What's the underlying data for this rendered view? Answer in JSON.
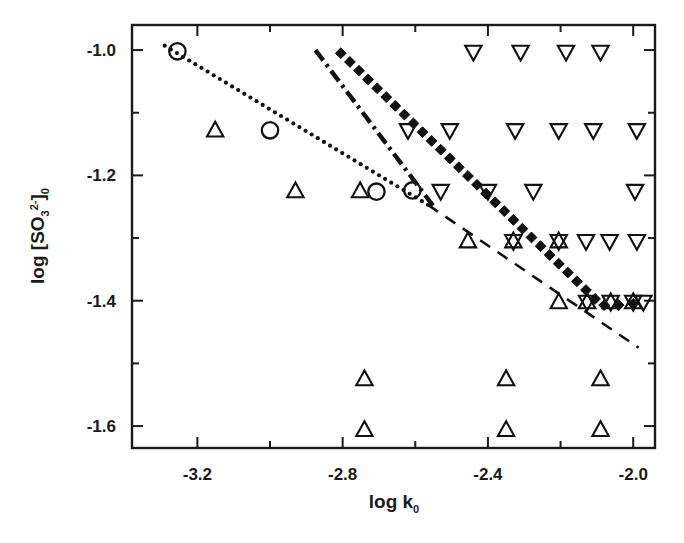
{
  "chart_data": {
    "type": "scatter",
    "title": "",
    "subtitle": "",
    "xlabel": "log k0",
    "xlabel_parts": {
      "base": "log k",
      "sub": "0"
    },
    "ylabel": "log [SO3 2-]0",
    "ylabel_parts": {
      "pre": "log [SO",
      "sub1": "3",
      "sup1": "2-",
      "post": "]",
      "sub2": "0"
    },
    "xlim": [
      -3.38,
      -1.94
    ],
    "ylim": [
      -1.635,
      -0.96
    ],
    "xticks": [
      -3.2,
      -2.8,
      -2.4,
      -2.0
    ],
    "xticklabels": [
      "-3.2",
      "-2.8",
      "-2.4",
      "-2.0"
    ],
    "xminorticks": [
      -3.0,
      -2.6,
      -2.2
    ],
    "yticks": [
      -1.0,
      -1.2,
      -1.4,
      -1.6
    ],
    "yticklabels": [
      "-1.0",
      "-1.2",
      "-1.4",
      "-1.6"
    ],
    "yminorticks": [
      -1.1,
      -1.3,
      -1.5
    ],
    "grid": false,
    "legend": "none",
    "frame": "box",
    "series": [
      {
        "name": "open-circle-points",
        "marker": "open-circle",
        "color": "#111111",
        "points": [
          {
            "x": -3.255,
            "y": -1.002
          },
          {
            "x": -3.0,
            "y": -1.128
          },
          {
            "x": -2.707,
            "y": -1.226
          },
          {
            "x": -2.608,
            "y": -1.224
          }
        ]
      },
      {
        "name": "up-triangle-points",
        "marker": "open-up-triangle",
        "color": "#111111",
        "points": [
          {
            "x": -3.151,
            "y": -1.128
          },
          {
            "x": -2.93,
            "y": -1.225
          },
          {
            "x": -2.752,
            "y": -1.225
          },
          {
            "x": -2.455,
            "y": -1.305
          },
          {
            "x": -2.33,
            "y": -1.305
          },
          {
            "x": -2.205,
            "y": -1.305
          },
          {
            "x": -2.205,
            "y": -1.402
          },
          {
            "x": -2.127,
            "y": -1.402
          },
          {
            "x": -2.062,
            "y": -1.402
          },
          {
            "x": -2.0,
            "y": -1.402
          },
          {
            "x": -2.74,
            "y": -1.525
          },
          {
            "x": -2.35,
            "y": -1.525
          },
          {
            "x": -2.09,
            "y": -1.525
          },
          {
            "x": -2.74,
            "y": -1.606
          },
          {
            "x": -2.35,
            "y": -1.606
          },
          {
            "x": -2.09,
            "y": -1.606
          }
        ]
      },
      {
        "name": "down-triangle-points",
        "marker": "open-down-triangle",
        "color": "#111111",
        "points": [
          {
            "x": -2.44,
            "y": -1.003
          },
          {
            "x": -2.31,
            "y": -1.003
          },
          {
            "x": -2.185,
            "y": -1.003
          },
          {
            "x": -2.09,
            "y": -1.003
          },
          {
            "x": -2.62,
            "y": -1.128
          },
          {
            "x": -2.505,
            "y": -1.128
          },
          {
            "x": -2.325,
            "y": -1.128
          },
          {
            "x": -2.205,
            "y": -1.128
          },
          {
            "x": -2.11,
            "y": -1.128
          },
          {
            "x": -1.99,
            "y": -1.128
          },
          {
            "x": -2.53,
            "y": -1.225
          },
          {
            "x": -2.4,
            "y": -1.225
          },
          {
            "x": -2.275,
            "y": -1.225
          },
          {
            "x": -1.995,
            "y": -1.225
          },
          {
            "x": -2.33,
            "y": -1.305
          },
          {
            "x": -2.205,
            "y": -1.305
          },
          {
            "x": -2.13,
            "y": -1.305
          },
          {
            "x": -2.065,
            "y": -1.305
          },
          {
            "x": -1.99,
            "y": -1.305
          },
          {
            "x": -2.127,
            "y": -1.402
          },
          {
            "x": -2.062,
            "y": -1.402
          },
          {
            "x": -2.0,
            "y": -1.402
          },
          {
            "x": -1.972,
            "y": -1.402
          }
        ]
      },
      {
        "name": "filled-diamond-line-points",
        "marker": "filled-diamond",
        "color": "#111111",
        "description": "thick diamond-dotted trend line",
        "points": [
          {
            "x": -2.805,
            "y": -1.005
          },
          {
            "x": -2.78,
            "y": -1.019
          },
          {
            "x": -2.755,
            "y": -1.033
          },
          {
            "x": -2.73,
            "y": -1.047
          },
          {
            "x": -2.705,
            "y": -1.061
          },
          {
            "x": -2.68,
            "y": -1.075
          },
          {
            "x": -2.655,
            "y": -1.089
          },
          {
            "x": -2.63,
            "y": -1.103
          },
          {
            "x": -2.605,
            "y": -1.117
          },
          {
            "x": -2.58,
            "y": -1.131
          },
          {
            "x": -2.555,
            "y": -1.145
          },
          {
            "x": -2.53,
            "y": -1.159
          },
          {
            "x": -2.505,
            "y": -1.173
          },
          {
            "x": -2.48,
            "y": -1.187
          },
          {
            "x": -2.455,
            "y": -1.201
          },
          {
            "x": -2.43,
            "y": -1.215
          },
          {
            "x": -2.405,
            "y": -1.229
          },
          {
            "x": -2.38,
            "y": -1.243
          },
          {
            "x": -2.355,
            "y": -1.257
          },
          {
            "x": -2.33,
            "y": -1.271
          },
          {
            "x": -2.305,
            "y": -1.285
          },
          {
            "x": -2.28,
            "y": -1.299
          },
          {
            "x": -2.255,
            "y": -1.313
          },
          {
            "x": -2.23,
            "y": -1.327
          },
          {
            "x": -2.205,
            "y": -1.341
          },
          {
            "x": -2.18,
            "y": -1.355
          },
          {
            "x": -2.155,
            "y": -1.369
          },
          {
            "x": -2.13,
            "y": -1.383
          },
          {
            "x": -2.105,
            "y": -1.397
          },
          {
            "x": -2.08,
            "y": -1.407
          },
          {
            "x": -2.04,
            "y": -1.407
          },
          {
            "x": -2.0,
            "y": -1.405
          }
        ]
      }
    ],
    "lines": [
      {
        "name": "fine-dotted-line",
        "style": "fine-dotted",
        "color": "#111111",
        "from": {
          "x": -3.29,
          "y": -0.993
        },
        "to": {
          "x": -2.565,
          "y": -1.247
        },
        "slope": -0.35
      },
      {
        "name": "dash-dot-steep-line",
        "style": "dash-dot-thick",
        "color": "#111111",
        "from": {
          "x": -2.875,
          "y": -1.0
        },
        "to": {
          "x": -2.545,
          "y": -1.253
        },
        "slope": -0.767
      },
      {
        "name": "dashed-lower-line",
        "style": "dashed",
        "color": "#111111",
        "from": {
          "x": -2.565,
          "y": -1.247
        },
        "to": {
          "x": -1.985,
          "y": -1.475
        },
        "slope": -0.393
      }
    ],
    "annotations": []
  }
}
